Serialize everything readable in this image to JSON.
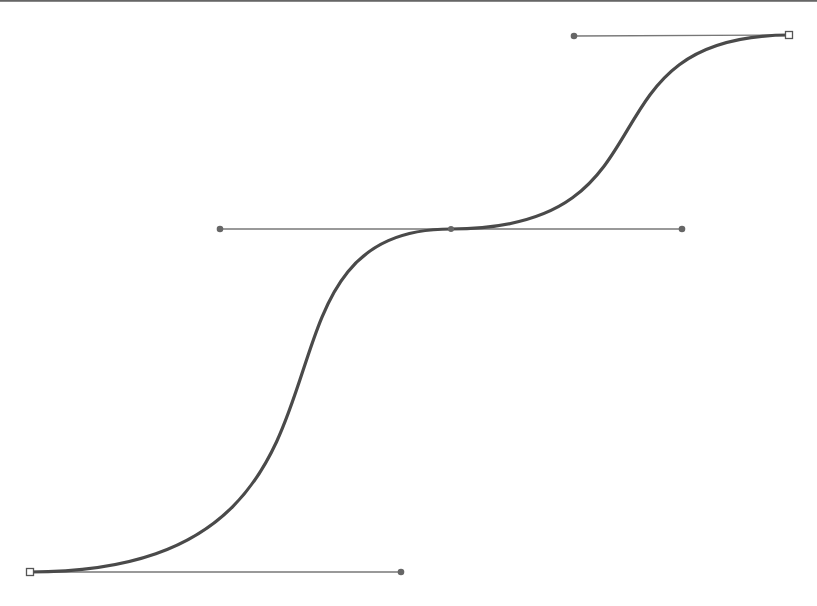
{
  "diagram": {
    "type": "bezier-path",
    "colors": {
      "background": "#ffffff",
      "curve": "#4a4a4a",
      "handle_line": "#777777",
      "handle_point": "#666666",
      "anchor_fill": "#ffffff",
      "anchor_stroke": "#555555",
      "top_border": "#666666"
    },
    "anchors": [
      {
        "id": "start",
        "x": 30,
        "y": 572,
        "shape": "square"
      },
      {
        "id": "mid",
        "x": 451,
        "y": 229,
        "shape": "diamond"
      },
      {
        "id": "end",
        "x": 789,
        "y": 35,
        "shape": "square"
      }
    ],
    "handles": [
      {
        "anchor": "start",
        "x": 401,
        "y": 572
      },
      {
        "anchor": "mid-in",
        "x": 220,
        "y": 229
      },
      {
        "anchor": "mid-out",
        "x": 682,
        "y": 229
      },
      {
        "anchor": "end",
        "x": 574,
        "y": 36
      }
    ],
    "segments": [
      {
        "from": "start",
        "c1": [
          401,
          572
        ],
        "c2": [
          220,
          229
        ],
        "to": "mid"
      },
      {
        "from": "mid",
        "c1": [
          682,
          229
        ],
        "c2": [
          574,
          36
        ],
        "to": "end"
      }
    ]
  }
}
